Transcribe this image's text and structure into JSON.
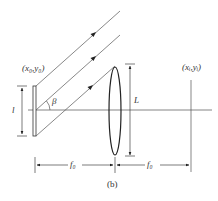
{
  "diagram": {
    "caption": "(b)",
    "source_point_label": "(x₀,y₀)",
    "image_point_label": "(xᵢ,yᵢ)",
    "source_height_label": "l",
    "lens_aperture_label": "L",
    "angle_label": "β",
    "focal_left_label": "f₀",
    "focal_right_label": "f₀",
    "colors": {
      "line": "#555555",
      "lens": "#222222",
      "text": "#333333",
      "background": "#ffffff"
    },
    "elements": [
      "source-aperture",
      "optical-axis",
      "parallel-rays",
      "lens",
      "image-plane",
      "dimension-l",
      "dimension-L",
      "dimension-f0-left",
      "dimension-f0-right",
      "angle-beta"
    ]
  }
}
